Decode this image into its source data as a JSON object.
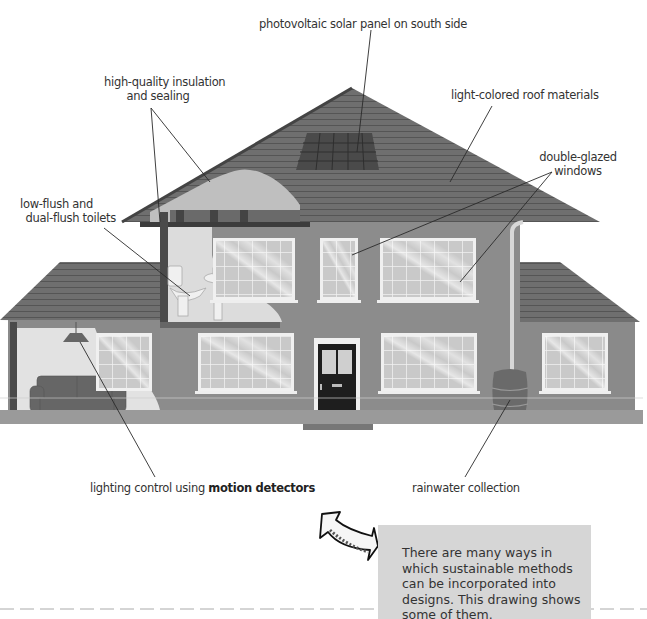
{
  "labels": {
    "solar": "photovoltaic solar panel on south side",
    "insulation_line1": "high-quality insulation",
    "insulation_line2": "and sealing",
    "roof": "light-colored roof materials",
    "glazing_line1": "double-glazed",
    "glazing_line2": "windows",
    "toilets_line1": "low-flush and",
    "toilets_line2": "dual-flush toilets",
    "lighting_prefix": "lighting control using ",
    "lighting_bold": "motion detectors",
    "rainwater": "rainwater collection"
  },
  "caption": {
    "text": "There are many ways in which sustainable methods can be incorporated into designs. This drawing shows some of them."
  },
  "icons": {
    "arrow": "curved-arrow-pointing-up-left"
  },
  "colors": {
    "wall": "#8a8a8a",
    "roof": "#6e6e6e",
    "interior": "#d9d9d9",
    "window_glass": "#c8c8c8",
    "door": "#1e1e1e",
    "caption_bg": "#d6d6d6",
    "leader_line": "#2a2a2a"
  }
}
